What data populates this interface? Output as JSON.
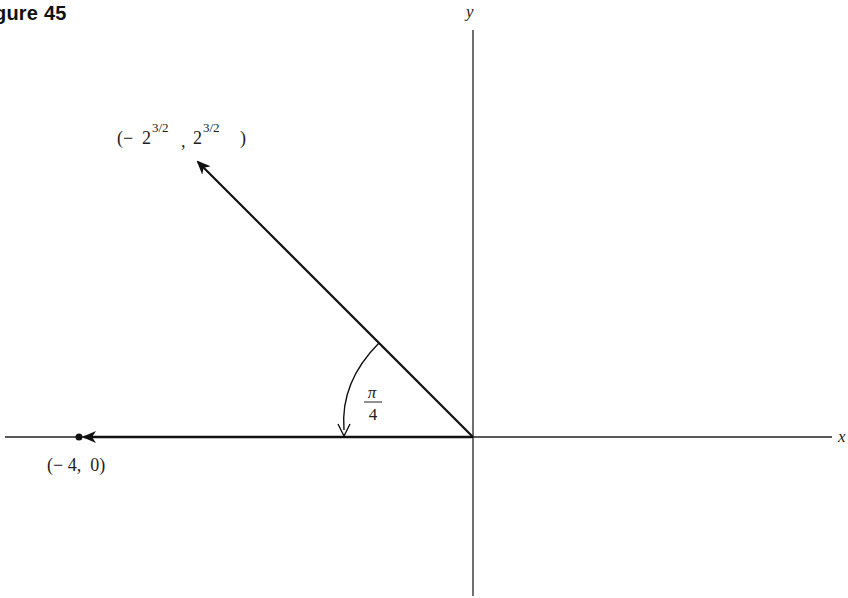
{
  "figure": {
    "title": "gure 45",
    "full_title": "Figure 45"
  },
  "axes": {
    "x_label": "x",
    "y_label": "y",
    "origin_px": [
      473,
      436
    ]
  },
  "vectors": [
    {
      "name": "vector-rotated",
      "label": "(− 2^{3/2}, 2^{3/2})",
      "label_parts": {
        "open": "(−",
        "base1": "2",
        "exp1": "3/2",
        "comma": ",",
        "base2": "2",
        "exp2": "3/2",
        "close": ")"
      },
      "tip_px": [
        196,
        160
      ]
    },
    {
      "name": "vector-original",
      "label": "(− 4, 0)",
      "label_text": "(− 4,  0)",
      "tip_px": [
        80,
        437
      ]
    }
  ],
  "angle": {
    "label_numerator": "π",
    "label_denominator": "4",
    "value": "π/4"
  },
  "colors": {
    "line": "#111111",
    "text": "#222222",
    "background": "#ffffff"
  }
}
